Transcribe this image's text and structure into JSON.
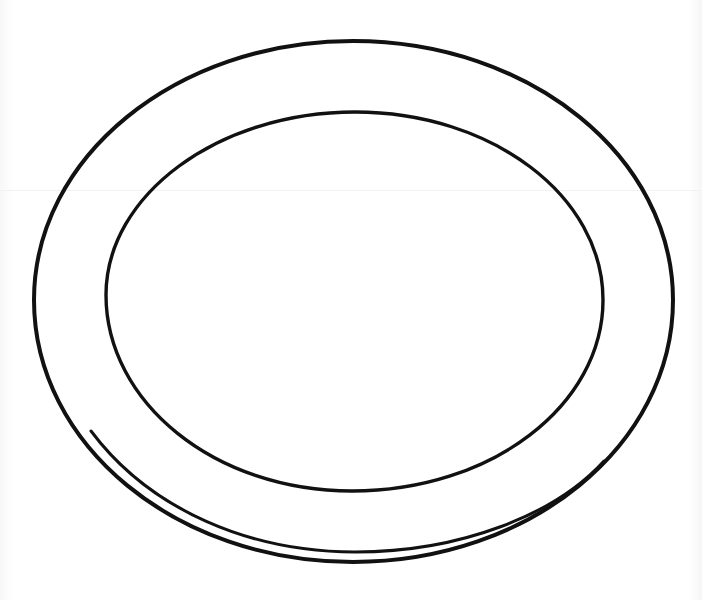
{
  "image": {
    "subject": "plate",
    "description": "Black line drawing of an empty oval plate seen from above, with an outer rim, inner well and a rim highlight arc along the bottom edge",
    "style": "line-art",
    "parts": [
      {
        "id": "outer-rim",
        "label": "Outer rim"
      },
      {
        "id": "inner-well",
        "label": "Inner well"
      },
      {
        "id": "rim-highlight",
        "label": "Rim highlight"
      }
    ]
  },
  "colors": {
    "background": "#ffffff",
    "line": "#111111"
  }
}
